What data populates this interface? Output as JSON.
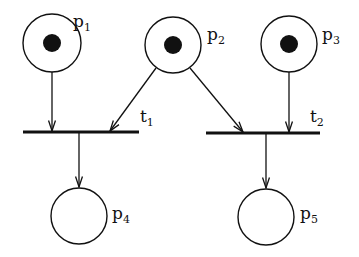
{
  "diagram": {
    "type": "petri-net",
    "colors": {
      "stroke": "#111111",
      "background": "#ffffff",
      "token": "#111111"
    },
    "places": [
      {
        "id": "p1",
        "base": "p",
        "sub": "1",
        "cx": 52,
        "cy": 43,
        "r": 29,
        "tokens": 1,
        "label_x": 73,
        "label_y": 27
      },
      {
        "id": "p2",
        "base": "p",
        "sub": "2",
        "cx": 173,
        "cy": 45,
        "r": 28,
        "tokens": 1,
        "label_x": 207,
        "label_y": 40
      },
      {
        "id": "p3",
        "base": "p",
        "sub": "3",
        "cx": 289,
        "cy": 44,
        "r": 28,
        "tokens": 1,
        "label_x": 322,
        "label_y": 40
      },
      {
        "id": "p4",
        "base": "p",
        "sub": "4",
        "cx": 79,
        "cy": 216,
        "r": 28,
        "tokens": 0,
        "label_x": 112,
        "label_y": 219
      },
      {
        "id": "p5",
        "base": "p",
        "sub": "5",
        "cx": 266,
        "cy": 217,
        "r": 28,
        "tokens": 0,
        "label_x": 300,
        "label_y": 219
      }
    ],
    "transitions": [
      {
        "id": "t1",
        "base": "t",
        "sub": "1",
        "x1": 23,
        "x2": 139,
        "y": 132,
        "label_x": 140,
        "label_y": 122
      },
      {
        "id": "t2",
        "base": "t",
        "sub": "2",
        "x1": 206,
        "x2": 320,
        "y": 133,
        "label_x": 310,
        "label_y": 122
      }
    ],
    "arcs": [
      {
        "from": "p1",
        "to": "t1",
        "x1": 52,
        "y1": 72,
        "x2": 52,
        "y2": 131
      },
      {
        "from": "p2",
        "to": "t1",
        "x1": 156,
        "y1": 68,
        "x2": 110,
        "y2": 131
      },
      {
        "from": "p2",
        "to": "t2",
        "x1": 190,
        "y1": 68,
        "x2": 243,
        "y2": 132
      },
      {
        "from": "p3",
        "to": "t2",
        "x1": 289,
        "y1": 72,
        "x2": 289,
        "y2": 132
      },
      {
        "from": "t1",
        "to": "p4",
        "x1": 79,
        "y1": 133,
        "x2": 79,
        "y2": 187
      },
      {
        "from": "t2",
        "to": "p5",
        "x1": 266,
        "y1": 134,
        "x2": 266,
        "y2": 188
      }
    ]
  }
}
